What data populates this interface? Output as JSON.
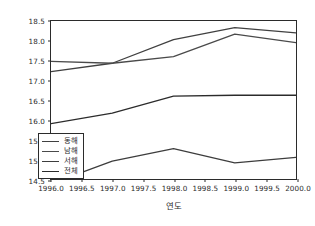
{
  "chart_data": {
    "type": "line",
    "title": "",
    "xlabel": "연도",
    "ylabel": "",
    "xlim": [
      1996.0,
      2000.0
    ],
    "ylim": [
      14.5,
      18.5
    ],
    "grid": false,
    "legend_position": "lower left",
    "x": [
      1996.0,
      1997.0,
      1998.0,
      1999.0,
      2000.0
    ],
    "xticks": [
      "1996.0",
      "1996.5",
      "1997.0",
      "1997.5",
      "1998.0",
      "1998.5",
      "1999.0",
      "1999.5",
      "2000.0"
    ],
    "xtick_values": [
      1996.0,
      1996.5,
      1997.0,
      1997.5,
      1998.0,
      1998.5,
      1999.0,
      1999.5,
      2000.0
    ],
    "yticks": [
      "14.5",
      "15.0",
      "15.5",
      "16.0",
      "16.5",
      "17.0",
      "17.5",
      "18.0",
      "18.5"
    ],
    "ytick_values": [
      14.5,
      15.0,
      15.5,
      16.0,
      16.5,
      17.0,
      17.5,
      18.0,
      18.5
    ],
    "series": [
      {
        "name": "동해",
        "color": "#404040",
        "values": [
          17.22,
          17.43,
          18.03,
          18.33,
          18.2
        ]
      },
      {
        "name": "남해",
        "color": "#4a4a4a",
        "values": [
          17.48,
          17.43,
          17.6,
          18.17,
          17.95
        ]
      },
      {
        "name": "서해",
        "color": "#3d3d3d",
        "values": [
          14.38,
          14.95,
          15.27,
          14.91,
          15.05
        ]
      },
      {
        "name": "전체",
        "color": "#2b2b2b",
        "values": [
          15.9,
          16.17,
          16.6,
          16.62,
          16.62
        ]
      }
    ]
  },
  "legend": {
    "items": [
      {
        "label": "동해"
      },
      {
        "label": "남해"
      },
      {
        "label": "서해"
      },
      {
        "label": "전체"
      }
    ]
  }
}
